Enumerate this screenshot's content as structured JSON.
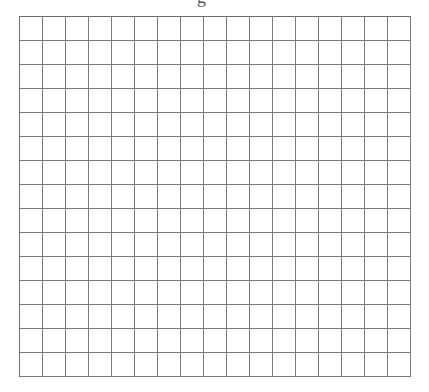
{
  "header": {
    "partial_title_glyph": "g"
  },
  "grid": {
    "columns": 17,
    "rows": 15,
    "cell_width_px": 23,
    "cell_height_px": 24,
    "line_color": "#7a7a7a",
    "background": "#ffffff"
  }
}
